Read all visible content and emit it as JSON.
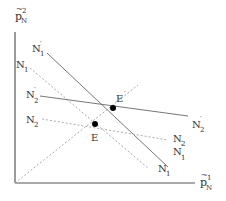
{
  "axes": {
    "y_label": {
      "base": "p",
      "accent": "~",
      "sup": "2",
      "sub": "N"
    },
    "x_label": {
      "base": "p",
      "accent": "~",
      "sup": "1",
      "sub": "N"
    }
  },
  "lines": [
    {
      "id": "N1prime",
      "label": "N",
      "sub": "1",
      "prime": "′",
      "style": "solid",
      "from": [
        47,
        53
      ],
      "to": [
        168,
        167
      ],
      "label_left": [
        32,
        52
      ],
      "label_right": [
        172,
        160
      ]
    },
    {
      "id": "N1",
      "label": "N",
      "sub": "1",
      "prime": "",
      "style": "dashed",
      "from": [
        30,
        68
      ],
      "to": [
        148,
        168
      ],
      "label_left": [
        16,
        72
      ],
      "label_right": [
        155,
        172
      ]
    },
    {
      "id": "N2prime",
      "label": "N",
      "sub": "2",
      "prime": "′",
      "style": "solid",
      "from": [
        40,
        96
      ],
      "to": [
        188,
        116
      ],
      "label_left": [
        25,
        98
      ],
      "label_right": [
        192,
        126
      ]
    },
    {
      "id": "N2",
      "label": "N",
      "sub": "2",
      "prime": "",
      "style": "dashed",
      "from": [
        42,
        119
      ],
      "to": [
        168,
        140
      ],
      "label_left": [
        25,
        123
      ],
      "label_right": [
        172,
        143
      ]
    }
  ],
  "points": [
    {
      "id": "E",
      "label": "E",
      "prime": "",
      "x": 95,
      "y": 124,
      "label_x": 91,
      "label_y": 140
    },
    {
      "id": "Eprime",
      "label": "E",
      "prime": "′",
      "x": 113,
      "y": 108,
      "label_x": 116,
      "label_y": 102
    }
  ],
  "ray": {
    "from": [
      15,
      183
    ],
    "to": [
      138,
      85
    ],
    "style": "dashed"
  },
  "colors": {
    "axis": "#555555",
    "solid_line": "#777777",
    "dashed_line": "#aaaaaa",
    "point": "#000000",
    "text": "#333333"
  }
}
